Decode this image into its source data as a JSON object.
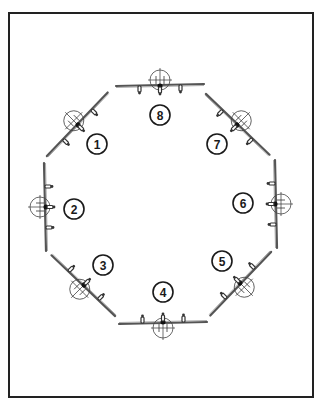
{
  "diagram": {
    "title": "",
    "frame_color": "#222222",
    "positions": [
      {
        "id": 1,
        "label": "1",
        "angle_deg": -45,
        "plane_cx": 78,
        "plane_cy": 125,
        "label_x": 97,
        "label_y": 144
      },
      {
        "id": 2,
        "label": "2",
        "angle_deg": -90,
        "plane_cx": 46,
        "plane_cy": 207,
        "label_x": 74,
        "label_y": 209
      },
      {
        "id": 3,
        "label": "3",
        "angle_deg": 45,
        "plane_cx": 84,
        "plane_cy": 285,
        "label_x": 103,
        "label_y": 265
      },
      {
        "id": 4,
        "label": "4",
        "angle_deg": 180,
        "plane_cx": 163,
        "plane_cy": 322,
        "label_x": 163,
        "label_y": 292
      },
      {
        "id": 5,
        "label": "5",
        "angle_deg": 135,
        "plane_cx": 240,
        "plane_cy": 283,
        "label_x": 222,
        "label_y": 261
      },
      {
        "id": 6,
        "label": "6",
        "angle_deg": 90,
        "plane_cx": 275,
        "plane_cy": 204,
        "label_x": 243,
        "label_y": 203
      },
      {
        "id": 7,
        "label": "7",
        "angle_deg": 225,
        "plane_cx": 237,
        "plane_cy": 125,
        "label_x": 217,
        "label_y": 144
      },
      {
        "id": 8,
        "label": "8",
        "angle_deg": 0,
        "plane_cx": 160,
        "plane_cy": 86,
        "label_x": 160,
        "label_y": 115
      }
    ]
  }
}
